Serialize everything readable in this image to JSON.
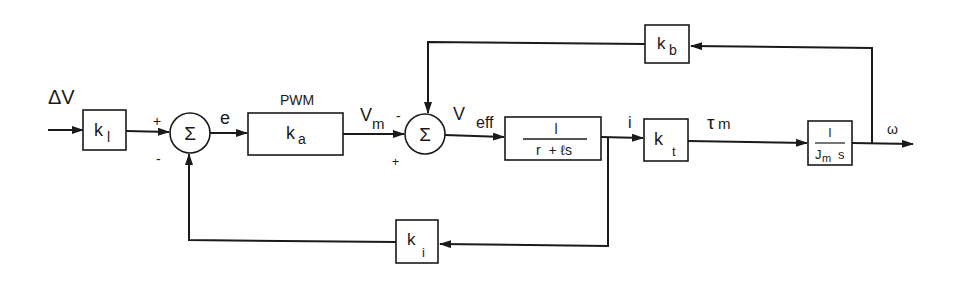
{
  "diagram": {
    "type": "block-diagram",
    "title": "",
    "input": {
      "label": "ΔV"
    },
    "output": {
      "label": "ω"
    },
    "blocks": [
      {
        "id": "k1",
        "main": "k",
        "sub": "l"
      },
      {
        "id": "ka",
        "main": "k",
        "sub": "a",
        "caption": "PWM"
      },
      {
        "id": "electrical",
        "numerator": "l",
        "denominator": "r  + ℓs"
      },
      {
        "id": "kt",
        "main": "k",
        "sub": "t"
      },
      {
        "id": "mechanical",
        "numerator": "l",
        "den_main": "J",
        "den_sub": "m",
        "den_tail": "s"
      },
      {
        "id": "kb",
        "main": "k",
        "sub": "b"
      },
      {
        "id": "ki",
        "main": "k",
        "sub": "i"
      }
    ],
    "summing_junctions": [
      {
        "id": "sum1",
        "symbol": "Σ",
        "signs": {
          "top_left": "+",
          "bottom_left": "-"
        }
      },
      {
        "id": "sum2",
        "symbol": "Σ",
        "signs": {
          "top_left": "-",
          "bottom_left": "+"
        }
      }
    ],
    "signals": {
      "e": "e",
      "vm_main": "V",
      "vm_sub": "m",
      "veff_main": "V",
      "veff_sub": "eff",
      "i": "i",
      "tau_main": "τ",
      "tau_sub": "m",
      "omega": "ω"
    },
    "colors": {
      "ink": "#1a1a1a",
      "background": "#ffffff"
    }
  }
}
